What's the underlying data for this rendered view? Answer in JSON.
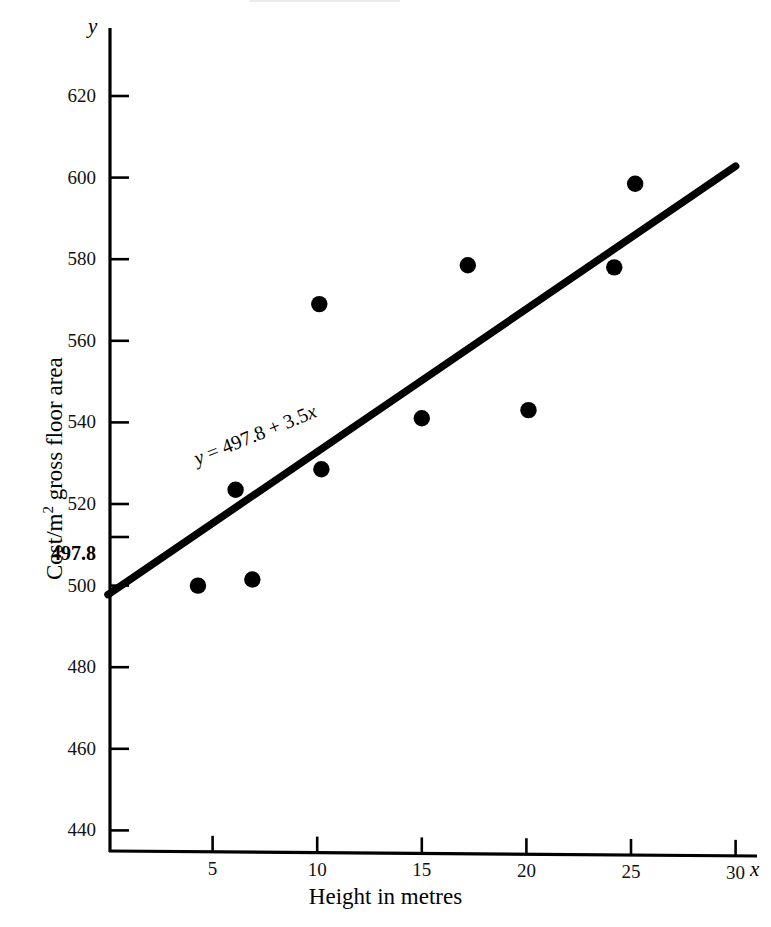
{
  "chart_data": {
    "type": "scatter",
    "title": "",
    "xlabel": "Height in metres",
    "ylabel": "Cost/m2 gross floor area",
    "ylabel_parts": {
      "prefix": "Cost/m",
      "exponent": "2",
      "suffix": " gross floor area"
    },
    "x_axis_variable": "x",
    "y_axis_variable": "y",
    "xlim": [
      0,
      31.5
    ],
    "ylim": [
      430,
      633
    ],
    "xticks": [
      5,
      10,
      15,
      20,
      25,
      30
    ],
    "yticks": [
      440,
      460,
      480,
      500,
      520,
      540,
      560,
      580,
      600,
      620
    ],
    "grid": false,
    "legend": null,
    "points": [
      {
        "x": 4.3,
        "y": 500.0
      },
      {
        "x": 6.1,
        "y": 523.5
      },
      {
        "x": 6.9,
        "y": 501.5
      },
      {
        "x": 10.1,
        "y": 569.0
      },
      {
        "x": 10.2,
        "y": 528.5
      },
      {
        "x": 15.0,
        "y": 541.0
      },
      {
        "x": 17.2,
        "y": 578.5
      },
      {
        "x": 20.1,
        "y": 543.0
      },
      {
        "x": 24.2,
        "y": 578.0
      },
      {
        "x": 25.2,
        "y": 598.5
      }
    ],
    "fit_line": {
      "equation_text": "y = 497.8 + 3.5x",
      "equation_y": "y",
      "equation_rhs": " = 497.8 + 3.5",
      "equation_var": "x",
      "intercept": 497.8,
      "slope": 3.5,
      "x_start": 0,
      "x_end": 30,
      "color": "#000000"
    },
    "intercept_label": "497.8",
    "annotations": [
      {
        "text": "y = 497.8 + 3.5x",
        "x": 10.5,
        "y": 533,
        "rotation": -22
      }
    ]
  },
  "axis": {
    "x_variable_label": "x",
    "y_variable_label": "y",
    "x_title": "Height in metres"
  }
}
